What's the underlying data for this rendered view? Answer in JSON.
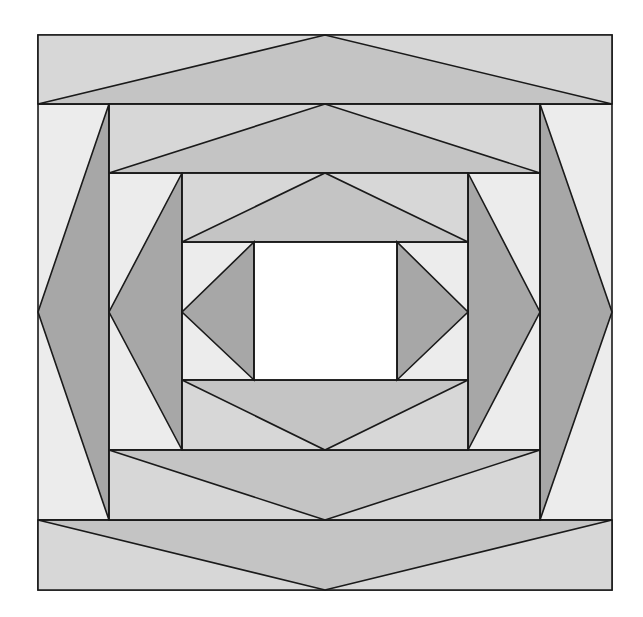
{
  "diagram": {
    "title": "Quilt block — concentric rings of triangles around a center square",
    "width": 643,
    "height": 617,
    "stroke": "#1a1a1a",
    "stroke_width": 1.6,
    "colors": {
      "background_light": "#ececec",
      "band": "#d7d7d7",
      "triangle_medium": "#c4c4c4",
      "triangle_dark": "#a7a7a7",
      "center": "#ffffff"
    },
    "shapes": [
      {
        "name": "outer-square",
        "fill": "background_light",
        "points": "38,35 612,35 612,590 38,590"
      },
      {
        "name": "ring1-top-band",
        "fill": "band",
        "points": "38,35 612,35 612,104 38,104"
      },
      {
        "name": "ring1-top-triangle",
        "fill": "triangle_medium",
        "points": "38,104 325,35 612,104"
      },
      {
        "name": "ring1-bottom-band",
        "fill": "band",
        "points": "38,520 612,520 612,590 38,590"
      },
      {
        "name": "ring1-bottom-triangle",
        "fill": "triangle_medium",
        "points": "38,520 612,520 325,590"
      },
      {
        "name": "ring1-left-triangle",
        "fill": "triangle_dark",
        "points": "109,104 109,520 38,312"
      },
      {
        "name": "ring1-right-triangle",
        "fill": "triangle_dark",
        "points": "540,104 540,520 612,312"
      },
      {
        "name": "ring2-inner-bg",
        "fill": "background_light",
        "points": "109,104 540,104 540,520 109,520"
      },
      {
        "name": "ring2-top-band",
        "fill": "band",
        "points": "109,104 540,104 540,173 109,173"
      },
      {
        "name": "ring2-top-triangle",
        "fill": "triangle_medium",
        "points": "109,173 325,104 540,173"
      },
      {
        "name": "ring2-bottom-band",
        "fill": "band",
        "points": "109,450 540,450 540,520 109,520"
      },
      {
        "name": "ring2-bottom-triangle",
        "fill": "triangle_medium",
        "points": "109,450 540,450 325,520"
      },
      {
        "name": "ring2-left-triangle",
        "fill": "triangle_dark",
        "points": "182,173 182,450 109,312"
      },
      {
        "name": "ring2-right-triangle",
        "fill": "triangle_dark",
        "points": "468,173 468,450 540,312"
      },
      {
        "name": "ring3-inner-bg",
        "fill": "background_light",
        "points": "182,173 468,173 468,450 182,450"
      },
      {
        "name": "ring3-top-band",
        "fill": "band",
        "points": "182,173 468,173 468,242 182,242"
      },
      {
        "name": "ring3-top-triangle",
        "fill": "triangle_medium",
        "points": "182,242 325,173 468,242"
      },
      {
        "name": "ring3-bottom-band",
        "fill": "band",
        "points": "182,380 468,380 468,450 182,450"
      },
      {
        "name": "ring3-bottom-triangle",
        "fill": "triangle_medium",
        "points": "182,380 468,380 325,450"
      },
      {
        "name": "ring3-left-triangle",
        "fill": "triangle_dark",
        "points": "254,242 254,380 182,312"
      },
      {
        "name": "ring3-right-triangle",
        "fill": "triangle_dark",
        "points": "397,242 397,380 468,312"
      },
      {
        "name": "center-square",
        "fill": "center",
        "points": "254,242 397,242 397,380 254,380"
      }
    ],
    "lines": [
      {
        "name": "ring1-top-divider",
        "points": "38,104 612,104"
      },
      {
        "name": "ring1-bottom-divider",
        "points": "38,520 612,520"
      },
      {
        "name": "ring2-left-edge",
        "points": "109,104 109,520"
      },
      {
        "name": "ring2-right-edge",
        "points": "540,104 540,520"
      },
      {
        "name": "ring2-top-divider",
        "points": "109,173 540,173"
      },
      {
        "name": "ring2-bottom-divider",
        "points": "109,450 540,450"
      },
      {
        "name": "ring3-left-edge",
        "points": "182,173 182,450"
      },
      {
        "name": "ring3-right-edge",
        "points": "468,173 468,450"
      },
      {
        "name": "ring3-top-divider",
        "points": "182,242 468,242"
      },
      {
        "name": "ring3-bottom-divider",
        "points": "182,380 468,380"
      },
      {
        "name": "center-left-edge",
        "points": "254,242 254,380"
      },
      {
        "name": "center-right-edge",
        "points": "397,242 397,380"
      }
    ]
  }
}
